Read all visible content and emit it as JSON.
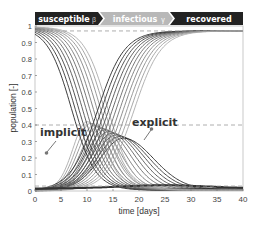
{
  "chart_data": {
    "type": "line",
    "title": "",
    "xlabel": "time [days]",
    "ylabel": "population [-]",
    "xlim": [
      0,
      40
    ],
    "ylim": [
      0,
      1
    ],
    "xticks": [
      0,
      5,
      10,
      15,
      20,
      25,
      30,
      35,
      40
    ],
    "yticks": [
      0,
      0.1,
      0.2,
      0.3,
      0.4,
      0.5,
      0.6,
      0.7,
      0.8,
      0.9,
      1
    ],
    "grid": false,
    "legend": null,
    "phase_banner": [
      {
        "label": "susceptible",
        "param": "β",
        "color": "#222222",
        "text_color": "#ffffff"
      },
      {
        "label": "infectious",
        "param": "γ",
        "color": "#b5b5b5",
        "text_color": "#ffffff"
      },
      {
        "label": "recovered",
        "param": "",
        "color": "#222222",
        "text_color": "#ffffff"
      }
    ],
    "reference_lines": [
      {
        "y": 0.97,
        "style": "dashed"
      },
      {
        "y": 0.4,
        "style": "dashed"
      },
      {
        "y": 0.03,
        "style": "dashed"
      }
    ],
    "annotations": [
      {
        "text": "implicit",
        "x": 4.5,
        "y": 0.34,
        "arrow_from": [
          2.2,
          0.23
        ],
        "arrow_to": [
          4.0,
          0.3
        ]
      },
      {
        "text": "explicit",
        "x": 21,
        "y": 0.41,
        "arrow_from": [
          17.5,
          0.28
        ],
        "arrow_to": [
          19.5,
          0.34
        ]
      }
    ],
    "series_groups": [
      {
        "name": "susceptible",
        "description": "family of decreasing sigmoid curves from 1 to ~0",
        "midpoints": [
          7,
          7.7,
          8.4,
          9.1,
          9.8,
          10.5,
          11.2,
          11.9,
          12.6,
          13.3,
          14
        ]
      },
      {
        "name": "infectious",
        "description": "family of hump curves peaking ~0.4 (implicit) to ~0.3 (explicit)",
        "peaks_t": [
          10,
          10.7,
          11.4,
          12.1,
          12.8,
          13.5,
          14.2,
          14.9,
          15.6,
          16.3,
          17
        ],
        "peaks_y": [
          0.42,
          0.41,
          0.4,
          0.39,
          0.38,
          0.37,
          0.36,
          0.35,
          0.34,
          0.33,
          0.32
        ]
      },
      {
        "name": "recovered",
        "description": "family of increasing sigmoid curves from 0 to ~0.97",
        "midpoints": [
          12,
          12.7,
          13.4,
          14.1,
          14.8,
          15.5,
          16.2,
          16.9,
          17.6,
          18.3,
          19
        ]
      }
    ]
  },
  "labels": {
    "xlabel": "time [days]",
    "ylabel": "population [-]",
    "implicit": "implicit",
    "explicit": "explicit",
    "susceptible": "susceptible",
    "beta": "β",
    "infectious": "infectious",
    "gamma": "γ",
    "recovered": "recovered"
  }
}
